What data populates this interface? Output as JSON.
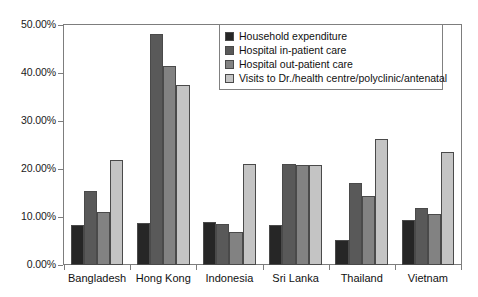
{
  "chart_data": {
    "type": "bar",
    "title": "",
    "subtitle": "",
    "xlabel": "",
    "ylabel": "",
    "ylim": [
      0,
      50
    ],
    "ytick_labels": [
      "0.00%",
      "10.00%",
      "20.00%",
      "30.00%",
      "40.00%",
      "50.00%"
    ],
    "ytick_values": [
      0,
      10,
      20,
      30,
      40,
      50
    ],
    "grid": false,
    "legend_position": "top-right-inside",
    "categories": [
      "Bangladesh",
      "Hong Kong",
      "Indonesia",
      "Sri Lanka",
      "Thailand",
      "Vietnam"
    ],
    "series": [
      {
        "name": "Household expenditure",
        "color": "#262626",
        "values": [
          8.4,
          8.8,
          9.0,
          8.3,
          5.3,
          9.3
        ]
      },
      {
        "name": "Hospital in-patient care",
        "color": "#595959",
        "values": [
          15.5,
          48.1,
          8.6,
          21.1,
          17.1,
          11.9
        ]
      },
      {
        "name": "Hospital out-patient care",
        "color": "#828282",
        "values": [
          11.0,
          41.4,
          6.9,
          20.8,
          14.4,
          10.6
        ]
      },
      {
        "name": "Visits to Dr./health centre/polyclinic/antenatal",
        "color": "#c4c4c4",
        "values": [
          21.9,
          37.4,
          21.1,
          20.8,
          26.3,
          23.5
        ]
      }
    ]
  }
}
